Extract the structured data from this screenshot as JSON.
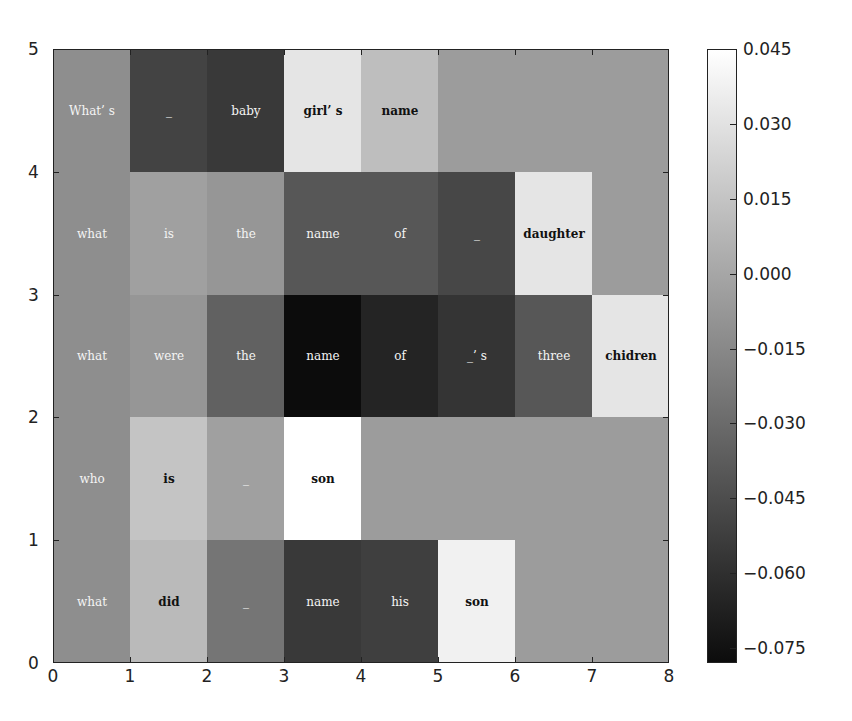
{
  "chart_data": {
    "type": "heatmap",
    "title": "",
    "xlabel": "",
    "ylabel": "",
    "xlim": [
      0,
      8
    ],
    "ylim": [
      0,
      5
    ],
    "x_ticks": [
      "0",
      "1",
      "2",
      "3",
      "4",
      "5",
      "6",
      "7",
      "8"
    ],
    "y_ticks": [
      "0",
      "1",
      "2",
      "3",
      "4",
      "5"
    ],
    "colormap": "gray",
    "colorbar": {
      "vmin": -0.078,
      "vmax": 0.045,
      "ticks": [
        "0.045",
        "0.030",
        "0.015",
        "0.000",
        "−0.015",
        "−0.030",
        "−0.045",
        "−0.060",
        "−0.075"
      ],
      "tick_values": [
        0.045,
        0.03,
        0.015,
        0.0,
        -0.015,
        -0.03,
        -0.045,
        -0.06,
        -0.075
      ]
    },
    "rows": [
      {
        "y": 4,
        "sentence": "What's _ baby girl's name",
        "tokens": [
          "What’ s",
          "_",
          "baby",
          "girl’ s",
          "name",
          "",
          "",
          ""
        ],
        "values": [
          -0.012,
          -0.05,
          -0.055,
          0.032,
          0.012,
          -0.005,
          -0.005,
          -0.005
        ]
      },
      {
        "y": 3,
        "sentence": "what is the name of _ daughter",
        "tokens": [
          "what",
          "is",
          "the",
          "name",
          "of",
          "_",
          "daughter",
          ""
        ],
        "values": [
          -0.012,
          -0.003,
          -0.008,
          -0.04,
          -0.04,
          -0.048,
          0.032,
          -0.005
        ]
      },
      {
        "y": 2,
        "sentence": "what were the name of _'s three chidren",
        "tokens": [
          "what",
          "were",
          "the",
          "name",
          "of",
          "_’ s",
          "three",
          "chidren"
        ],
        "values": [
          -0.012,
          -0.008,
          -0.035,
          -0.078,
          -0.066,
          -0.058,
          -0.04,
          0.032
        ]
      },
      {
        "y": 1,
        "sentence": "who is _ son",
        "tokens": [
          "who",
          "is",
          "_",
          "son",
          "",
          "",
          "",
          ""
        ],
        "values": [
          -0.012,
          0.015,
          -0.003,
          0.045,
          -0.005,
          -0.005,
          -0.005,
          -0.005
        ]
      },
      {
        "y": 0,
        "sentence": "what did _ name his son",
        "tokens": [
          "what",
          "did",
          "_",
          "name",
          "his",
          "son",
          "",
          ""
        ],
        "values": [
          -0.012,
          0.01,
          -0.025,
          -0.055,
          -0.052,
          0.038,
          -0.005,
          -0.005
        ]
      }
    ]
  }
}
